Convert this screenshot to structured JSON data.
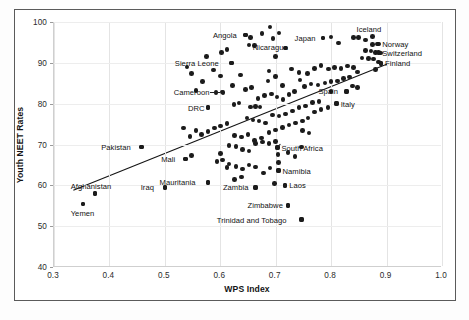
{
  "chart_data": {
    "type": "scatter",
    "title": "",
    "xlabel": "WPS Index",
    "ylabel": "Youth NEET Rates",
    "xlim": [
      0.3,
      1.0
    ],
    "ylim": [
      40,
      100
    ],
    "xticks": [
      "0.3",
      "0.4",
      "0.5",
      "0.6",
      "0.7",
      "0.8",
      "0.9",
      "1.0"
    ],
    "xtick_values": [
      0.3,
      0.4,
      0.5,
      0.6,
      0.7,
      0.8,
      0.9,
      1.0
    ],
    "yticks": [
      "40",
      "50",
      "60",
      "70",
      "80",
      "90",
      "100"
    ],
    "ytick_values": [
      40,
      50,
      60,
      70,
      80,
      90,
      100
    ],
    "grid": true,
    "legend": "none",
    "trendline": {
      "type": "linear",
      "x_start": 0.335,
      "y_start": 58.6,
      "x_end": 0.905,
      "y_end": 89.8
    },
    "annotations": [
      {
        "label": "Angola",
        "x": 0.645,
        "y": 96.8,
        "side": "left"
      },
      {
        "label": "Nicaragua",
        "x": 0.695,
        "y": 96.0,
        "side": "below"
      },
      {
        "label": "Japan",
        "x": 0.785,
        "y": 96.1,
        "side": "left"
      },
      {
        "label": "Iceland",
        "x": 0.875,
        "y": 96.4,
        "side": "above"
      },
      {
        "label": "Norway",
        "x": 0.885,
        "y": 94.6,
        "side": "right"
      },
      {
        "label": "Switzerland",
        "x": 0.885,
        "y": 92.5,
        "side": "right"
      },
      {
        "label": "Finland",
        "x": 0.89,
        "y": 89.9,
        "side": "right"
      },
      {
        "label": "Sierra Leone",
        "x": 0.62,
        "y": 90.0,
        "side": "left"
      },
      {
        "label": "Cameroon",
        "x": 0.605,
        "y": 82.8,
        "side": "left-leader"
      },
      {
        "label": "DRC",
        "x": 0.578,
        "y": 79.0,
        "side": "left"
      },
      {
        "label": "Spain",
        "x": 0.828,
        "y": 83.0,
        "side": "left"
      },
      {
        "label": "Italy",
        "x": 0.81,
        "y": 80.0,
        "side": "right"
      },
      {
        "label": "Pakistan",
        "x": 0.458,
        "y": 69.4,
        "side": "left"
      },
      {
        "label": "Mali",
        "x": 0.537,
        "y": 66.4,
        "side": "left"
      },
      {
        "label": "South Africa",
        "x": 0.703,
        "y": 69.2,
        "side": "right-leader"
      },
      {
        "label": "Namibia",
        "x": 0.705,
        "y": 63.6,
        "side": "right"
      },
      {
        "label": "Mauritania",
        "x": 0.578,
        "y": 60.7,
        "side": "left"
      },
      {
        "label": "Iraq",
        "x": 0.5,
        "y": 59.5,
        "side": "left"
      },
      {
        "label": "Afghanistan",
        "x": 0.374,
        "y": 58.0,
        "side": "above"
      },
      {
        "label": "Yemen",
        "x": 0.352,
        "y": 55.4,
        "side": "below"
      },
      {
        "label": "Zambia",
        "x": 0.663,
        "y": 59.5,
        "side": "left"
      },
      {
        "label": "Laos",
        "x": 0.717,
        "y": 60.0,
        "side": "right"
      },
      {
        "label": "Zimbabwe",
        "x": 0.722,
        "y": 55.1,
        "side": "left"
      },
      {
        "label": "Trinidad and Tobago",
        "x": 0.747,
        "y": 51.6,
        "side": "left"
      }
    ],
    "points": [
      [
        0.645,
        96.8
      ],
      [
        0.655,
        96.2
      ],
      [
        0.652,
        94.4
      ],
      [
        0.662,
        94.3
      ],
      [
        0.602,
        92.6
      ],
      [
        0.612,
        93.3
      ],
      [
        0.675,
        97.2
      ],
      [
        0.69,
        98.8
      ],
      [
        0.706,
        97.3
      ],
      [
        0.718,
        93.6
      ],
      [
        0.7,
        91.5
      ],
      [
        0.688,
        88.0
      ],
      [
        0.785,
        96.1
      ],
      [
        0.8,
        96.3
      ],
      [
        0.813,
        94.9
      ],
      [
        0.84,
        96.2
      ],
      [
        0.849,
        96.2
      ],
      [
        0.862,
        95.6
      ],
      [
        0.875,
        94.5
      ],
      [
        0.884,
        94.6
      ],
      [
        0.862,
        93.0
      ],
      [
        0.872,
        92.9
      ],
      [
        0.88,
        92.6
      ],
      [
        0.889,
        92.4
      ],
      [
        0.856,
        91.2
      ],
      [
        0.867,
        91.0
      ],
      [
        0.876,
        90.9
      ],
      [
        0.885,
        90.2
      ],
      [
        0.89,
        89.9
      ],
      [
        0.88,
        88.4
      ],
      [
        0.62,
        90.0
      ],
      [
        0.637,
        87.0
      ],
      [
        0.592,
        82.8
      ],
      [
        0.603,
        82.9
      ],
      [
        0.578,
        79.0
      ],
      [
        0.625,
        79.8
      ],
      [
        0.655,
        79.2
      ],
      [
        0.663,
        79.3
      ],
      [
        0.672,
        79.2
      ],
      [
        0.686,
        85.6
      ],
      [
        0.7,
        86.6
      ],
      [
        0.712,
        84.5
      ],
      [
        0.728,
        88.5
      ],
      [
        0.742,
        87.6
      ],
      [
        0.757,
        87.4
      ],
      [
        0.77,
        88.6
      ],
      [
        0.782,
        89.4
      ],
      [
        0.795,
        88.5
      ],
      [
        0.806,
        88.9
      ],
      [
        0.818,
        88.6
      ],
      [
        0.83,
        89.2
      ],
      [
        0.84,
        88.8
      ],
      [
        0.848,
        87.8
      ],
      [
        0.833,
        86.5
      ],
      [
        0.822,
        86.2
      ],
      [
        0.812,
        85.6
      ],
      [
        0.8,
        85.4
      ],
      [
        0.789,
        85.1
      ],
      [
        0.776,
        84.6
      ],
      [
        0.764,
        84.8
      ],
      [
        0.752,
        84.2
      ],
      [
        0.744,
        85.8
      ],
      [
        0.734,
        83.0
      ],
      [
        0.724,
        82.3
      ],
      [
        0.713,
        81.0
      ],
      [
        0.702,
        81.6
      ],
      [
        0.692,
        82.4
      ],
      [
        0.68,
        82.0
      ],
      [
        0.668,
        81.3
      ],
      [
        0.828,
        83.0
      ],
      [
        0.81,
        80.0
      ],
      [
        0.838,
        84.3
      ],
      [
        0.848,
        84.0
      ],
      [
        0.8,
        83.0
      ],
      [
        0.656,
        84.0
      ],
      [
        0.645,
        83.5
      ],
      [
        0.634,
        80.2
      ],
      [
        0.622,
        84.4
      ],
      [
        0.6,
        86.8
      ],
      [
        0.588,
        88.2
      ],
      [
        0.568,
        85.5
      ],
      [
        0.556,
        83.2
      ],
      [
        0.548,
        87.4
      ],
      [
        0.54,
        89.0
      ],
      [
        0.575,
        91.5
      ],
      [
        0.648,
        76.5
      ],
      [
        0.659,
        76.0
      ],
      [
        0.67,
        75.8
      ],
      [
        0.682,
        75.3
      ],
      [
        0.694,
        77.2
      ],
      [
        0.706,
        77.0
      ],
      [
        0.718,
        77.5
      ],
      [
        0.73,
        78.2
      ],
      [
        0.742,
        79.0
      ],
      [
        0.754,
        79.4
      ],
      [
        0.766,
        80.3
      ],
      [
        0.778,
        80.6
      ],
      [
        0.612,
        75.2
      ],
      [
        0.6,
        74.5
      ],
      [
        0.59,
        74.0
      ],
      [
        0.578,
        73.2
      ],
      [
        0.566,
        72.4
      ],
      [
        0.556,
        73.5
      ],
      [
        0.545,
        72.0
      ],
      [
        0.534,
        74.0
      ],
      [
        0.626,
        72.2
      ],
      [
        0.638,
        71.8
      ],
      [
        0.65,
        72.5
      ],
      [
        0.662,
        71.0
      ],
      [
        0.674,
        71.6
      ],
      [
        0.688,
        73.0
      ],
      [
        0.7,
        73.6
      ],
      [
        0.712,
        74.2
      ],
      [
        0.724,
        74.8
      ],
      [
        0.736,
        75.3
      ],
      [
        0.748,
        75.8
      ],
      [
        0.758,
        76.5
      ],
      [
        0.616,
        69.8
      ],
      [
        0.628,
        69.5
      ],
      [
        0.64,
        68.8
      ],
      [
        0.652,
        68.4
      ],
      [
        0.664,
        70.2
      ],
      [
        0.676,
        70.6
      ],
      [
        0.688,
        70.2
      ],
      [
        0.7,
        70.8
      ],
      [
        0.703,
        69.2
      ],
      [
        0.704,
        67.5
      ],
      [
        0.705,
        65.6
      ],
      [
        0.705,
        63.6
      ],
      [
        0.69,
        64.2
      ],
      [
        0.678,
        63.0
      ],
      [
        0.664,
        64.5
      ],
      [
        0.652,
        65.0
      ],
      [
        0.64,
        64.0
      ],
      [
        0.628,
        64.6
      ],
      [
        0.616,
        65.2
      ],
      [
        0.604,
        66.2
      ],
      [
        0.594,
        65.8
      ],
      [
        0.77,
        78.0
      ],
      [
        0.782,
        78.6
      ],
      [
        0.794,
        79.0
      ],
      [
        0.722,
        68.0
      ],
      [
        0.735,
        67.0
      ],
      [
        0.746,
        69.4
      ],
      [
        0.748,
        73.5
      ],
      [
        0.76,
        72.8
      ],
      [
        0.458,
        69.4
      ],
      [
        0.537,
        66.4
      ],
      [
        0.548,
        67.3
      ],
      [
        0.6,
        67.8
      ],
      [
        0.612,
        64.4
      ],
      [
        0.578,
        60.7
      ],
      [
        0.5,
        59.5
      ],
      [
        0.374,
        58.0
      ],
      [
        0.352,
        55.4
      ],
      [
        0.663,
        59.5
      ],
      [
        0.698,
        60.4
      ],
      [
        0.717,
        60.0
      ],
      [
        0.722,
        55.1
      ],
      [
        0.747,
        51.6
      ],
      [
        0.626,
        61.5
      ],
      [
        0.638,
        62.0
      ]
    ]
  }
}
